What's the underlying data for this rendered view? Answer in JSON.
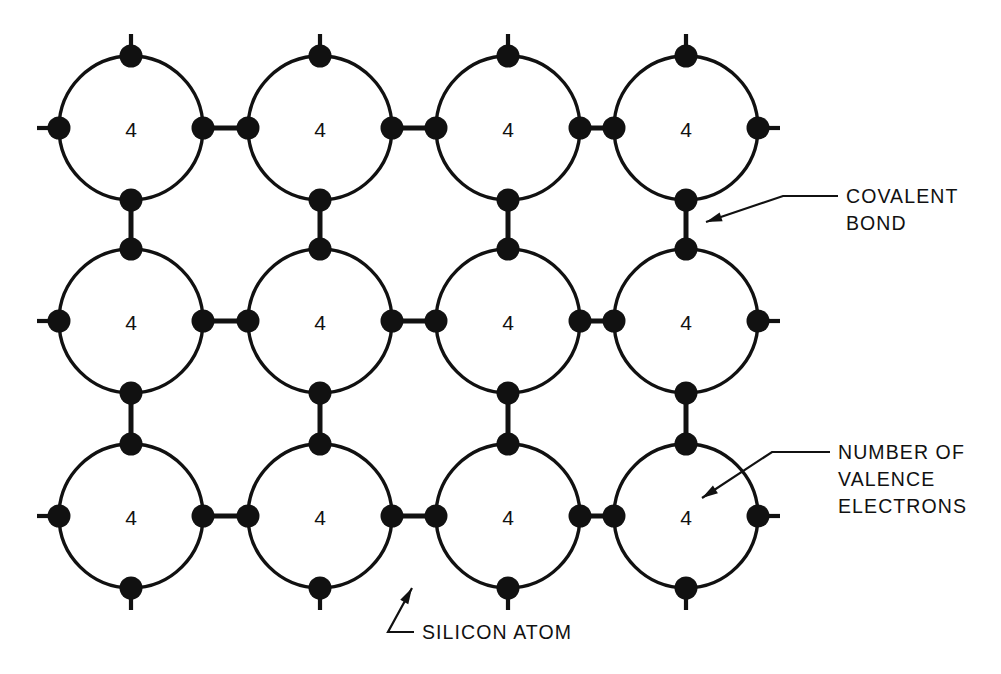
{
  "canvas": {
    "width": 1001,
    "height": 674,
    "background": "#ffffff"
  },
  "style": {
    "stroke_color": "#111111",
    "circle_stroke_width": 3.4,
    "bond_stroke_width": 5.0,
    "stub_stroke_width": 4.2,
    "leader_stroke_width": 2.2,
    "dot_radius": 11.5,
    "circle_radius": 72
  },
  "lattice": {
    "rows": 3,
    "cols": 4,
    "col_centers": [
      131,
      320,
      508,
      686
    ],
    "row_centers": [
      128,
      321,
      516
    ],
    "cell_label": "4",
    "dot_positions": [
      "north",
      "south",
      "east",
      "west"
    ],
    "edge_stub_length": 22,
    "description": "Silicon crystal lattice: circles represent silicon atoms, filled dots represent valence electrons, short bars joining dots represent covalent bonds."
  },
  "annotations": [
    {
      "id": "covalent-bond",
      "lines": [
        "COVALENT",
        "BOND"
      ],
      "text_x": 846,
      "text_y": 196,
      "line_height": 27,
      "leader": [
        [
          838,
          196
        ],
        [
          783,
          196
        ],
        [
          706,
          222
        ]
      ],
      "arrow_at": [
        706,
        222
      ],
      "arrow_angle": 161
    },
    {
      "id": "valence-electrons",
      "lines": [
        "NUMBER OF",
        "VALENCE",
        "ELECTRONS"
      ],
      "text_x": 838,
      "text_y": 452,
      "line_height": 27,
      "leader": [
        [
          830,
          452
        ],
        [
          772,
          452
        ],
        [
          702,
          498
        ]
      ],
      "arrow_at": [
        702,
        498
      ],
      "arrow_angle": 147
    },
    {
      "id": "silicon-atom",
      "lines": [
        "SILICON ATOM"
      ],
      "text_x": 422,
      "text_y": 632,
      "line_height": 27,
      "leader": [
        [
          414,
          632
        ],
        [
          388,
          632
        ],
        [
          412,
          588
        ]
      ],
      "arrow_at": [
        412,
        588
      ],
      "arrow_angle": -61
    }
  ]
}
